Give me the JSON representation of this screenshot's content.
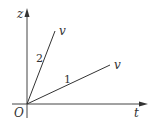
{
  "diagram": {
    "type": "z-t graph",
    "axes": {
      "vertical_label": "z",
      "horizontal_label": "t",
      "origin_label": "O"
    },
    "lines": [
      {
        "id": "line-2",
        "number_label": "2",
        "end_label": "v"
      },
      {
        "id": "line-1",
        "number_label": "1",
        "end_label": "v"
      }
    ],
    "colors": {
      "stroke": "#333333",
      "background": "#ffffff"
    }
  }
}
